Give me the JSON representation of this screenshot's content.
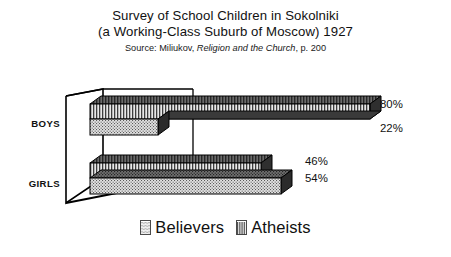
{
  "chart_data": {
    "type": "bar",
    "orientation": "horizontal",
    "style": "3d-stacked-rows",
    "title": "Survey of School Children in Sokolniki (a Working-Class Suburb of Moscow) 1927",
    "title_lines": [
      "Survey of School Children in Sokolniki",
      "(a Working-Class Suburb of Moscow) 1927"
    ],
    "source": {
      "prefix": "Source: Miliukov, ",
      "book": "Religion and the Church",
      "suffix": ", p. 200"
    },
    "categories": [
      "BOYS",
      "GIRLS"
    ],
    "series": [
      {
        "name": "Believers",
        "pattern": "dotted",
        "values": [
          22,
          54
        ],
        "value_labels": [
          "22%",
          "54%"
        ]
      },
      {
        "name": "Atheists",
        "pattern": "striped",
        "values": [
          80,
          46
        ],
        "value_labels": [
          "80%",
          "46%"
        ]
      }
    ],
    "value_suffix": "%",
    "xlabel": "",
    "ylabel": "",
    "xlim": [
      0,
      100
    ],
    "grid": false,
    "legend_position": "bottom",
    "legend_entries": [
      "Believers",
      "Atheists"
    ],
    "colors": {
      "outline": "#000000",
      "bar_top_face": "#4d4d4d",
      "bar_side_face": "#3a3a3a",
      "believers_fill": "#c9c9c9",
      "atheists_fill": "#9a9a9a",
      "background": "#ffffff",
      "text": "#111111"
    }
  },
  "axis": {
    "boys_label": "BOYS",
    "girls_label": "GIRLS"
  },
  "values": {
    "boys_atheists": "80%",
    "boys_believers": "22%",
    "girls_atheists": "46%",
    "girls_believers": "54%"
  },
  "legend": {
    "believers_label": "Believers",
    "atheists_label": "Atheists"
  }
}
